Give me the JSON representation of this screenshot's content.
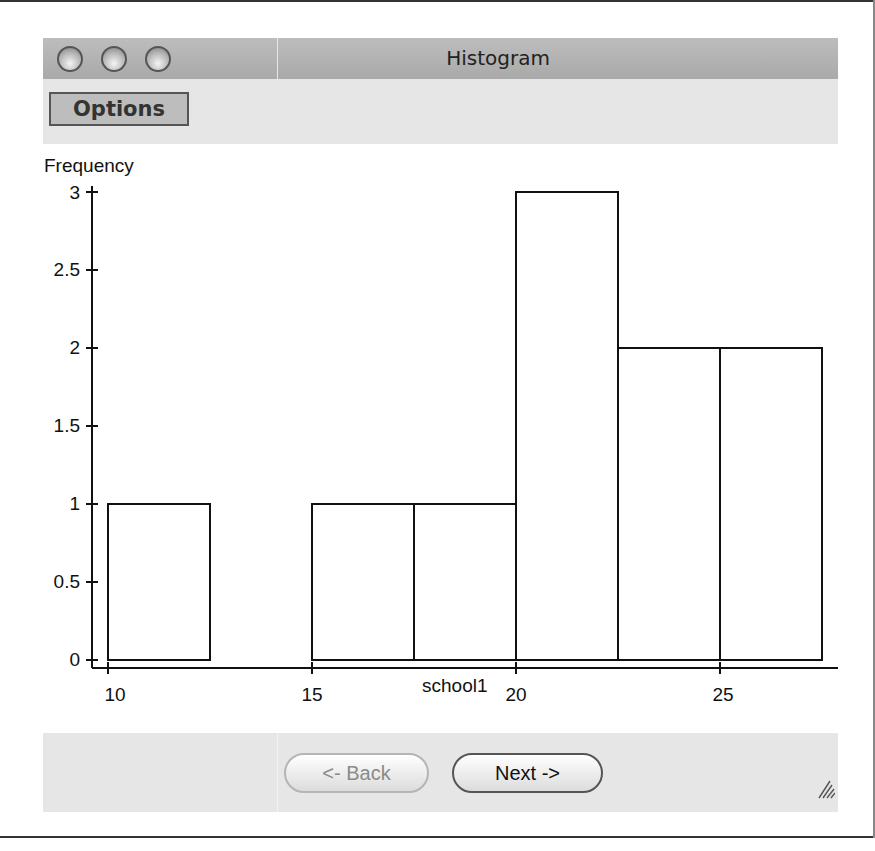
{
  "window": {
    "title": "Histogram",
    "traffic_lights": [
      "close-button",
      "minimize-button",
      "zoom-button"
    ]
  },
  "toolbar": {
    "options_label": "Options"
  },
  "footer": {
    "back_label": "<- Back",
    "next_label": "Next ->",
    "back_enabled": false
  },
  "colors": {
    "titlebar": "#b3b3b3",
    "panel": "#e6e6e6",
    "bar_fill": "#ffffff",
    "bar_stroke": "#111111",
    "axis": "#111111"
  },
  "chart_data": {
    "type": "bar",
    "title": "",
    "xlabel": "school1",
    "ylabel": "Frequency",
    "bin_width": 2.5,
    "bins": [
      {
        "start": 10,
        "end": 12.5,
        "count": 1
      },
      {
        "start": 12.5,
        "end": 15,
        "count": 0
      },
      {
        "start": 15,
        "end": 17.5,
        "count": 1
      },
      {
        "start": 17.5,
        "end": 20,
        "count": 1
      },
      {
        "start": 20,
        "end": 22.5,
        "count": 3
      },
      {
        "start": 22.5,
        "end": 25,
        "count": 2
      },
      {
        "start": 25,
        "end": 27.5,
        "count": 2
      }
    ],
    "categories": [
      "10-12.5",
      "12.5-15",
      "15-17.5",
      "17.5-20",
      "20-22.5",
      "22.5-25",
      "25-27.5"
    ],
    "values": [
      1,
      0,
      1,
      1,
      3,
      2,
      2
    ],
    "x_ticks": [
      10,
      15,
      20,
      25
    ],
    "y_ticks": [
      0,
      0.5,
      1,
      1.5,
      2,
      2.5,
      3
    ],
    "y_tick_labels": [
      "0",
      "0.5",
      "1",
      "1.5",
      "2",
      "2.5",
      "3"
    ],
    "x_tick_labels": [
      "10",
      "15",
      "20",
      "25"
    ],
    "xlim": [
      9.8,
      28.2
    ],
    "ylim": [
      0,
      3
    ],
    "grid": false,
    "legend": null
  }
}
